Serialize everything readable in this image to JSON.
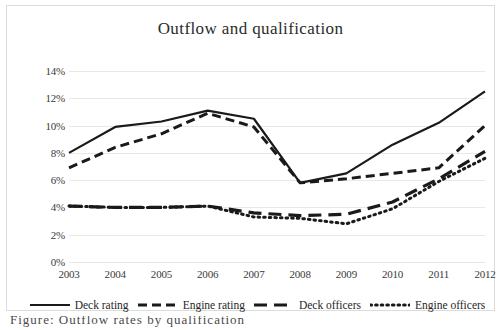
{
  "chart_data": {
    "type": "line",
    "title": "Outflow and qualification",
    "xlabel": "",
    "ylabel": "",
    "categories": [
      "2003",
      "2004",
      "2005",
      "2006",
      "2007",
      "2008",
      "2009",
      "2010",
      "2011",
      "2012"
    ],
    "ylim": [
      0,
      14
    ],
    "ytick_labels": [
      "0%",
      "2%",
      "4%",
      "6%",
      "8%",
      "10%",
      "12%",
      "14%"
    ],
    "ytick_values": [
      0,
      2,
      4,
      6,
      8,
      10,
      12,
      14
    ],
    "grid": true,
    "legend_position": "bottom",
    "series": [
      {
        "name": "Deck rating",
        "style": "solid",
        "color": "#1a1a1a",
        "values": [
          8.0,
          9.9,
          10.3,
          11.1,
          10.5,
          5.8,
          6.5,
          8.6,
          10.2,
          12.5
        ]
      },
      {
        "name": "Engine rating",
        "style": "dashed",
        "color": "#1a1a1a",
        "values": [
          6.9,
          8.4,
          9.4,
          10.9,
          9.9,
          5.8,
          6.1,
          6.5,
          6.9,
          10.0
        ]
      },
      {
        "name": "Deck officers",
        "style": "long-dashed",
        "color": "#1a1a1a",
        "values": [
          4.1,
          4.0,
          4.0,
          4.1,
          3.6,
          3.4,
          3.5,
          4.4,
          6.1,
          8.1
        ]
      },
      {
        "name": "Engine officers",
        "style": "dotted",
        "color": "#1a1a1a",
        "values": [
          4.1,
          4.0,
          4.0,
          4.1,
          3.3,
          3.2,
          2.8,
          3.9,
          5.9,
          7.6
        ]
      }
    ]
  },
  "caption": {
    "text": "Figure: Outflow rates by qualification"
  }
}
